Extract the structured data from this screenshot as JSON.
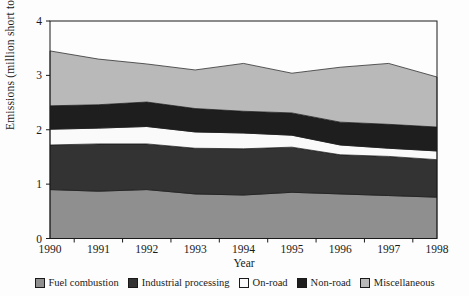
{
  "figure": {
    "background": "#fdfdfd",
    "frame_color": "#1a1a1a"
  },
  "chart_data": {
    "type": "area",
    "stacked": true,
    "title": "",
    "xlabel": "Year",
    "ylabel": "Emissions (million short tons)",
    "x": [
      1990,
      1991,
      1992,
      1993,
      1994,
      1995,
      1996,
      1997,
      1998
    ],
    "x_tick_labels": [
      "1990",
      "1991",
      "1992",
      "1993",
      "1994",
      "1995",
      "1996",
      "1997",
      "1998"
    ],
    "ylim": [
      0,
      4
    ],
    "yticks": [
      0,
      1,
      2,
      3,
      4
    ],
    "grid": false,
    "legend_position": "bottom",
    "series": [
      {
        "name": "Fuel combustion",
        "color": "#8f8f8f",
        "values": [
          0.9,
          0.87,
          0.9,
          0.82,
          0.8,
          0.85,
          0.82,
          0.79,
          0.76
        ]
      },
      {
        "name": "Industrial processing",
        "color": "#333333",
        "values": [
          0.82,
          0.87,
          0.84,
          0.84,
          0.85,
          0.83,
          0.72,
          0.72,
          0.69
        ]
      },
      {
        "name": "On-road",
        "color": "#fafafa",
        "values": [
          0.29,
          0.29,
          0.32,
          0.3,
          0.29,
          0.22,
          0.18,
          0.15,
          0.16
        ]
      },
      {
        "name": "Non-road",
        "color": "#1e1e1e",
        "values": [
          0.43,
          0.43,
          0.45,
          0.43,
          0.4,
          0.41,
          0.42,
          0.44,
          0.44
        ]
      },
      {
        "name": "Miscellaneous",
        "color": "#b9b9b9",
        "values": [
          1.01,
          0.84,
          0.7,
          0.71,
          0.88,
          0.73,
          1.01,
          1.12,
          0.92
        ]
      }
    ],
    "cumulative_totals": [
      3.45,
      3.3,
      3.21,
      3.1,
      3.22,
      3.04,
      3.15,
      3.22,
      2.97
    ]
  }
}
